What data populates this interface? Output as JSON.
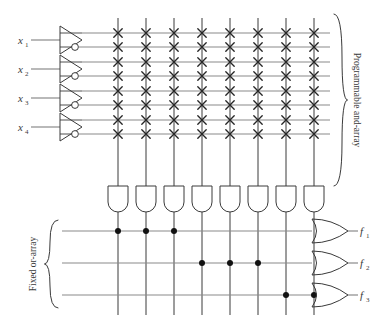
{
  "diagram": {
    "stroke_color": "#3a3a3a",
    "accent_color": "#8a8a8a",
    "bg_color": "#ffffff"
  },
  "inputs": {
    "labels": [
      "x1",
      "x2",
      "x3",
      "x4"
    ],
    "display": [
      "x",
      "x",
      "x",
      "x"
    ],
    "subscripts": [
      "1",
      "2",
      "3",
      "4"
    ],
    "count": 4,
    "buffer_icon": "buffer-inverter-triangle",
    "bubble_icon": "inversion-bubble"
  },
  "and_array": {
    "label": "Programmable and-array",
    "brace_icon": "curly-brace-right",
    "rows": 8,
    "columns": 8,
    "row_lines": [
      "x1",
      "x1-bar",
      "x2",
      "x2-bar",
      "x3",
      "x3-bar",
      "x4",
      "x4-bar"
    ],
    "crosspoints": [
      [
        1,
        1,
        1,
        1,
        1,
        1,
        1,
        1
      ],
      [
        1,
        1,
        1,
        1,
        1,
        1,
        1,
        1
      ],
      [
        1,
        1,
        1,
        1,
        1,
        1,
        1,
        1
      ],
      [
        1,
        1,
        1,
        1,
        1,
        1,
        1,
        1
      ],
      [
        1,
        1,
        1,
        1,
        1,
        1,
        1,
        1
      ],
      [
        1,
        1,
        1,
        1,
        1,
        1,
        1,
        1
      ],
      [
        1,
        1,
        1,
        1,
        1,
        1,
        1,
        1
      ],
      [
        1,
        1,
        1,
        1,
        1,
        1,
        1,
        1
      ]
    ],
    "cross_icon": "x-crosspoint-mark",
    "gate_icon": "and-gate",
    "gate_count": 8
  },
  "or_array": {
    "label": "Fixed or-array",
    "brace_icon": "curly-brace-left",
    "rows": 3,
    "columns": 8,
    "dot_icon": "connection-dot",
    "connections": [
      [
        1,
        1,
        1,
        0,
        0,
        0,
        0,
        0
      ],
      [
        0,
        0,
        0,
        1,
        1,
        1,
        0,
        0
      ],
      [
        0,
        0,
        0,
        0,
        0,
        0,
        1,
        1
      ]
    ],
    "gate_icon": "or-gate",
    "gate_count": 3
  },
  "outputs": {
    "labels": [
      "f1",
      "f2",
      "f3"
    ],
    "display": [
      "f",
      "f",
      "f"
    ],
    "subscripts": [
      "1",
      "2",
      "3"
    ],
    "count": 3
  }
}
